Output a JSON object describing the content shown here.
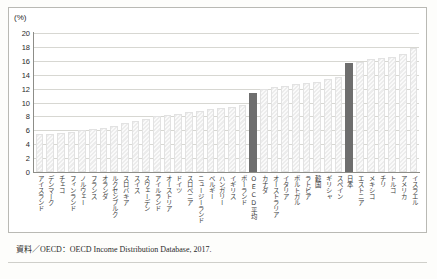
{
  "figure": {
    "unit_label": "(%)",
    "caption": "資料／OECD：OECD Income Distribution Database, 2017."
  },
  "colors": {
    "bar_fill": "#ececec",
    "bar_highlight": "#6e6e6e",
    "grid": "#d7d7d2",
    "axis": "#8d8d88",
    "text": "#2a2a2a"
  },
  "chart_data": {
    "type": "bar",
    "title": "",
    "xlabel": "",
    "ylabel": "(%)",
    "ylim": [
      0,
      20
    ],
    "yticks": [
      0,
      2,
      4,
      6,
      8,
      10,
      12,
      14,
      16,
      18,
      20
    ],
    "grid": true,
    "legend": "none",
    "highlight_categories": [
      "OECD平均",
      "日本"
    ],
    "categories": [
      "アイスランド",
      "デンマーク",
      "チェコ",
      "フィンランド",
      "ノルウェー",
      "フランス",
      "オランダ",
      "ルクセンブルク",
      "スロバキア",
      "スイス",
      "スウェーデン",
      "アイルランド",
      "オーストリア",
      "ドイツ",
      "スロベニア",
      "ニュージーランド",
      "ベルギー",
      "ハンガリー",
      "イギリス",
      "ポーランド",
      "OECD平均",
      "カナダ",
      "オーストラリア",
      "イタリア",
      "ポルトガル",
      "ラトビア",
      "韓国",
      "ギリシャ",
      "スペイン",
      "日本",
      "エストニア",
      "メキシコ",
      "チリ",
      "トルコ",
      "アメリカ",
      "イスラエル"
    ],
    "values": [
      5.4,
      5.5,
      5.6,
      5.8,
      6.0,
      6.2,
      6.4,
      6.6,
      7.0,
      7.4,
      7.7,
      8.0,
      8.2,
      8.4,
      8.6,
      8.8,
      9.0,
      9.2,
      9.4,
      9.6,
      11.4,
      12.0,
      12.2,
      12.4,
      12.6,
      12.8,
      13.0,
      13.4,
      13.6,
      15.7,
      15.9,
      16.2,
      16.4,
      16.6,
      17.0,
      17.9
    ]
  }
}
